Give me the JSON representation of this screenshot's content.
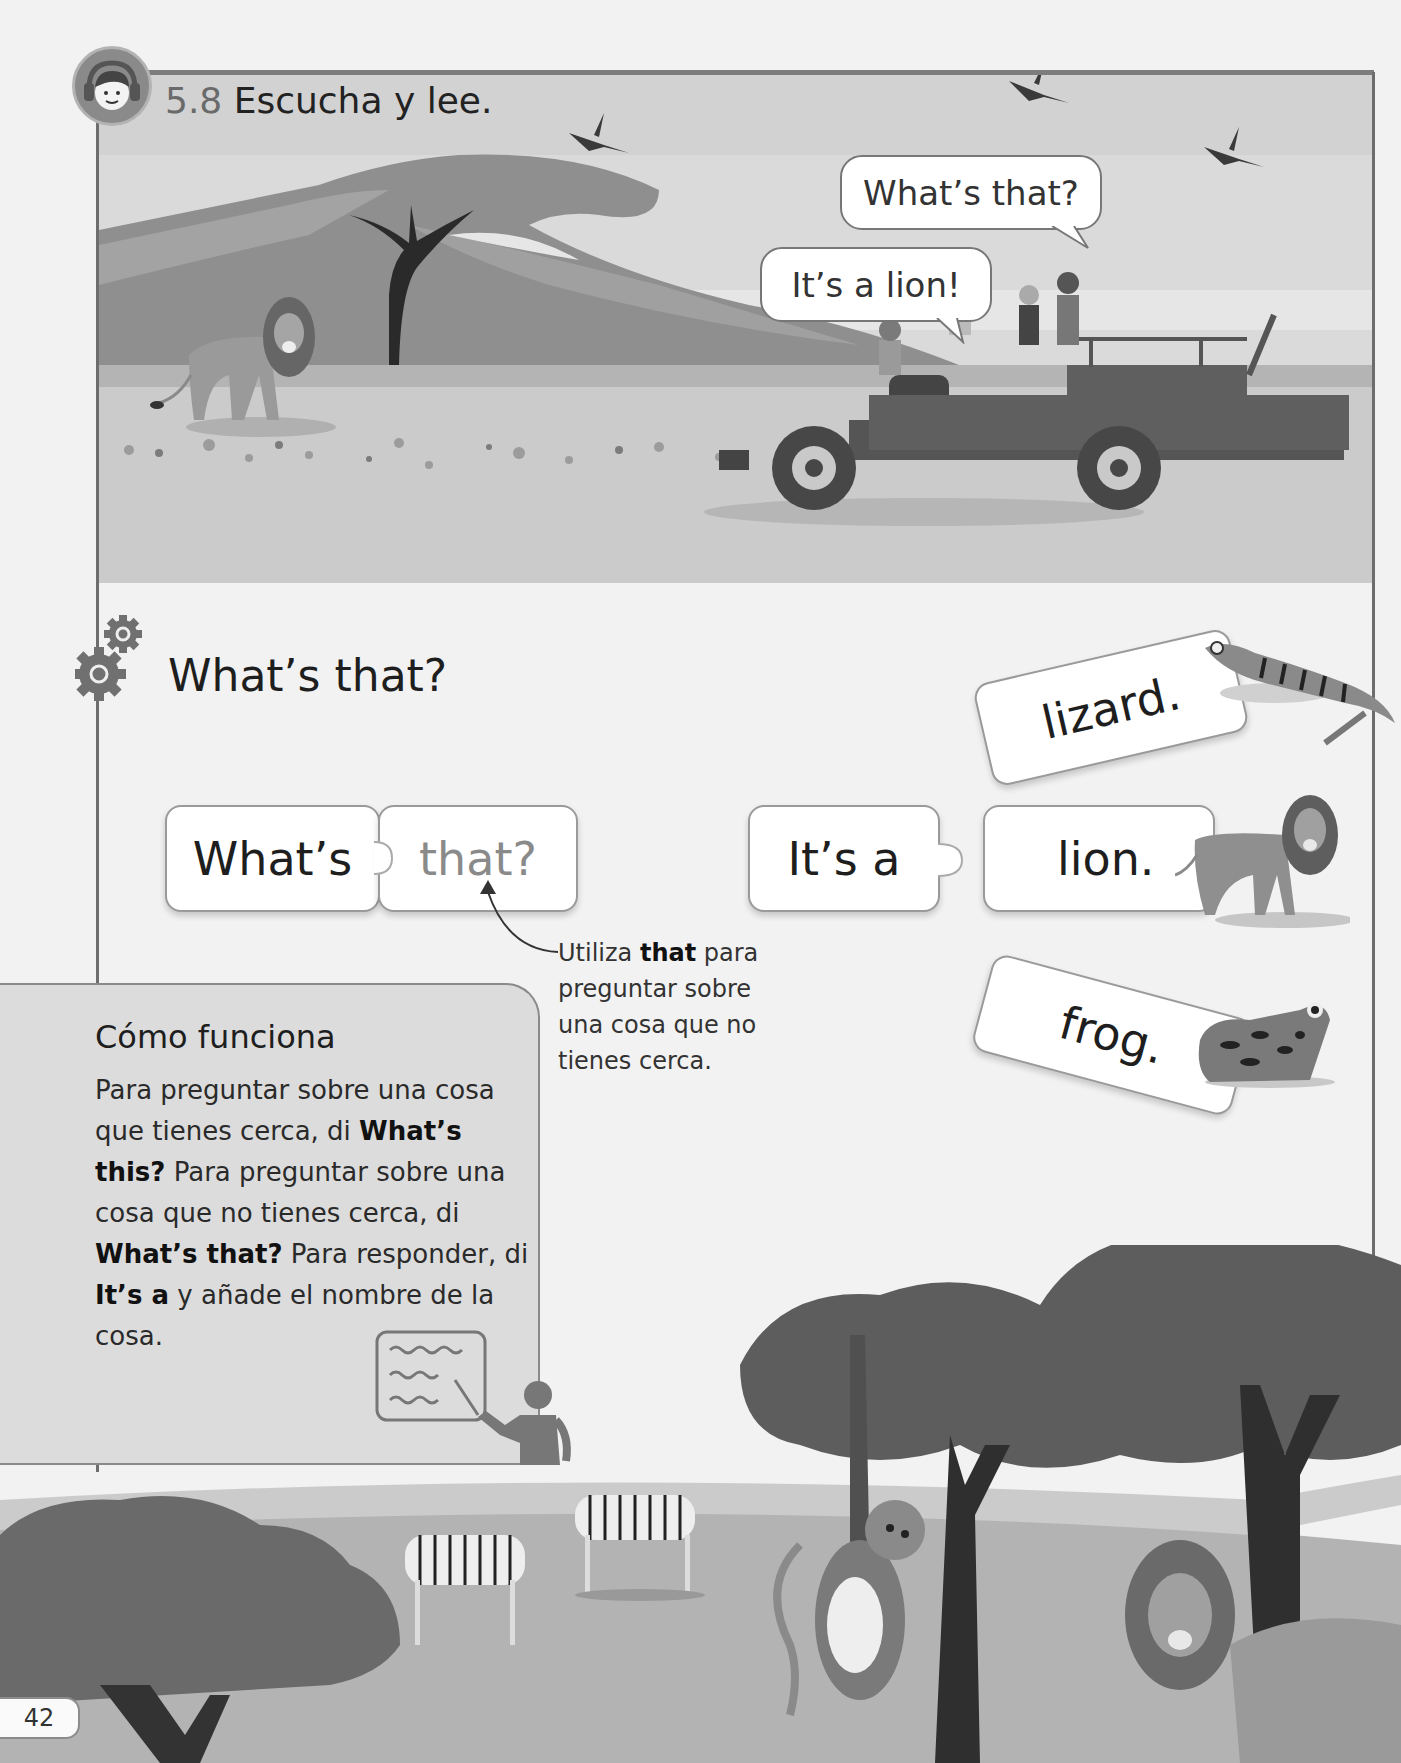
{
  "header": {
    "exercise_number": "5.8",
    "instruction": "Escucha y lee.",
    "icon": "listening-child-headphones-icon"
  },
  "scene_top": {
    "speech_bubbles": [
      {
        "speaker": "child-with-binoculars",
        "text": "What’s that?"
      },
      {
        "speaker": "driver",
        "text": "It’s a lion!"
      }
    ],
    "illustrations": [
      "lion",
      "acacia-tree",
      "mountain",
      "birds",
      "safari-jeep",
      "children"
    ]
  },
  "section": {
    "icon": "gears-icon",
    "title": "What’s that?"
  },
  "puzzle": {
    "question": [
      {
        "text": "What’s",
        "style": "normal"
      },
      {
        "text": "that?",
        "style": "highlight"
      }
    ],
    "answer_start": {
      "text": "It’s a"
    },
    "answer_options": [
      {
        "text": "lizard.",
        "animal": "lizard"
      },
      {
        "text": "lion.",
        "animal": "lion"
      },
      {
        "text": "frog.",
        "animal": "frog"
      }
    ]
  },
  "annotation": {
    "pre": "Utiliza ",
    "bold": "that",
    "post": " para preguntar sobre una cosa que no tienes cerca."
  },
  "how_it_works": {
    "title": "Cómo funciona",
    "parts": [
      {
        "t": "Para preguntar sobre una cosa que tienes cerca, di ",
        "b": false
      },
      {
        "t": "What’s this?",
        "b": true
      },
      {
        "t": " Para preguntar sobre una cosa que no tienes cerca, di ",
        "b": false
      },
      {
        "t": "What’s that?",
        "b": true
      },
      {
        "t": " Para responder, di ",
        "b": false
      },
      {
        "t": "It’s a",
        "b": true
      },
      {
        "t": " y añade el nombre de la cosa.",
        "b": false
      }
    ],
    "icon": "teacher-whiteboard-icon"
  },
  "scene_bottom": {
    "illustrations": [
      "bushes",
      "zebras",
      "monkey",
      "trees",
      "lion"
    ]
  },
  "footer": {
    "page_number": "42"
  }
}
